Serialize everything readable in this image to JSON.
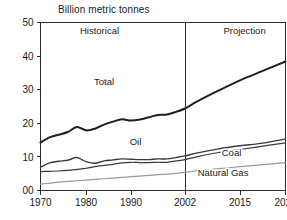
{
  "chart_data": {
    "type": "line",
    "title": "Billion metric tonnes",
    "xlabel": "",
    "ylabel": "",
    "ylim": [
      0,
      50
    ],
    "ytick_labels": [
      "50",
      "40",
      "30",
      "20",
      "10",
      "00"
    ],
    "ytick_values": [
      50,
      40,
      30,
      20,
      10,
      0
    ],
    "xtick_labels": [
      "1970",
      "1980",
      "1990",
      "2002",
      "2015",
      "2025"
    ],
    "xtick_values": [
      1970,
      1980,
      1990,
      2002,
      2015,
      2025
    ],
    "grid": false,
    "legend": "inline-labels",
    "annotations": [
      {
        "text": "Historical",
        "x": 1983,
        "y": 46.5
      },
      {
        "text": "Projection",
        "x": 2016,
        "y": 46.5
      }
    ],
    "divider": {
      "x": 2002,
      "label": "2002"
    },
    "x": [
      1970,
      1972,
      1974,
      1976,
      1978,
      1980,
      1982,
      1984,
      1986,
      1988,
      1990,
      1992,
      1994,
      1996,
      1998,
      2000,
      2002,
      2005,
      2010,
      2015,
      2020,
      2025
    ],
    "series": [
      {
        "name": "Total",
        "color": "#1f1f1f",
        "width": 2.0,
        "label_x": 1984,
        "label_y": 31.5,
        "values": [
          14.3,
          15.8,
          16.6,
          17.4,
          18.9,
          17.9,
          18.4,
          19.6,
          20.5,
          21.2,
          20.8,
          21.1,
          21.8,
          22.5,
          22.6,
          23.4,
          24.4,
          26.6,
          29.8,
          32.8,
          35.6,
          38.4
        ]
      },
      {
        "name": "Oil",
        "color": "#3a3a3a",
        "width": 1.4,
        "label_x": 1991,
        "label_y": 13.6,
        "values": [
          6.9,
          8.2,
          8.7,
          9.0,
          9.8,
          8.6,
          8.1,
          8.8,
          9.1,
          9.4,
          9.3,
          9.2,
          9.2,
          9.4,
          9.4,
          9.8,
          10.3,
          11.2,
          12.4,
          13.3,
          14.1,
          15.3
        ]
      },
      {
        "name": "Coal",
        "color": "#3a3a3a",
        "width": 1.2,
        "label_x": 2013,
        "label_y": 10.3,
        "values": [
          5.6,
          5.7,
          5.8,
          6.0,
          6.3,
          6.6,
          7.1,
          7.5,
          7.8,
          8.2,
          8.4,
          8.3,
          8.3,
          8.4,
          8.4,
          8.8,
          9.2,
          10.1,
          11.3,
          12.2,
          13.2,
          14.2
        ]
      },
      {
        "name": "Natural Gas",
        "color": "#9a9a9a",
        "width": 1.2,
        "label_x": 2011,
        "label_y": 4.2,
        "values": [
          1.9,
          2.2,
          2.5,
          2.7,
          2.9,
          3.1,
          3.3,
          3.5,
          3.7,
          3.9,
          4.1,
          4.3,
          4.5,
          4.7,
          4.9,
          5.1,
          5.4,
          5.9,
          6.5,
          7.1,
          7.7,
          8.3
        ]
      }
    ]
  }
}
